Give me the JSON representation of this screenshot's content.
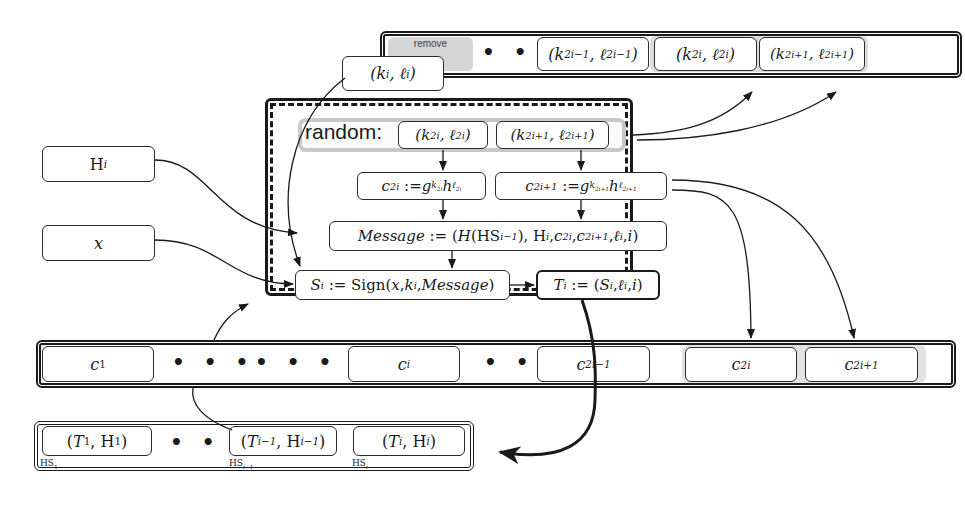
{
  "top_strip": {
    "remove_label": "remove",
    "k_i_l_i": "(k_i, ℓ_i)",
    "dots": "• • •",
    "k_2i-1": "(k_{2i-1}, ℓ_{2i-1})",
    "k_2i": "(k_{2i}, ℓ_{2i})",
    "k_2i+1": "(k_{2i+1}, ℓ_{2i+1})"
  },
  "inputs": {
    "H_i": "H_i",
    "x": "x"
  },
  "process": {
    "random_label": "random:",
    "rand_k2i": "(k_{2i}, ℓ_{2i})",
    "rand_k2i1": "(k_{2i+1}, ℓ_{2i+1})",
    "c2i": "c_{2i} := g^{k_{2i}} h^{ℓ_{2i}}",
    "c2i1": "c_{2i+1} := g^{k_{2i+1}} h^{ℓ_{2i+1}}",
    "message": "Message := (H(HS_{i-1}), H_i, c_{2i}, c_{2i+1}, ℓ_i, i)",
    "sign": "S_i := Sign(x, k_i, Message)",
    "T": "T_i := (S_i, ℓ_i, i)"
  },
  "commit_strip": {
    "c1": "c_1",
    "dots1": "• • •",
    "dots2": "• • •",
    "ci": "c_i",
    "dots3": "• • •",
    "c2i-1": "c_{2i-1}",
    "c2i": "c_{2i}",
    "c2i+1": "c_{2i+1}"
  },
  "chain_strip": {
    "T1": "(T_1, H_1)",
    "dots": "• • •",
    "Ti-1": "(T_{i-1}, H_{i-1})",
    "Ti": "(T_i, H_i)",
    "HS1": "HS_1",
    "HSi-1": "HS_{i-1}",
    "HSi": "HS_i"
  }
}
